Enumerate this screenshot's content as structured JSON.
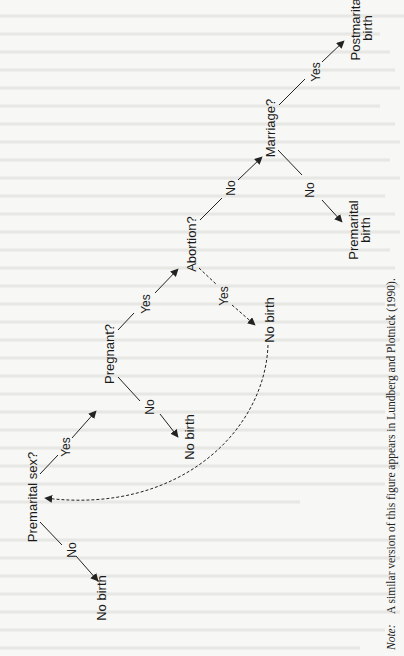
{
  "figure": {
    "type": "decision-tree",
    "orientation": "rotated-90-ccw",
    "nodes": {
      "premarital_sex": "Premarital sex?",
      "pregnant": "Pregnant?",
      "abortion": "Abortion?",
      "marriage": "Marriage?",
      "postmarital_birth_line1": "Postmarital",
      "postmarital_birth_line2": "birth",
      "premarital_birth_line1": "Premarital",
      "premarital_birth_line2": "birth",
      "no_birth_abortion": "No birth",
      "no_birth_not_pregnant": "No birth",
      "no_birth_no_sex": "No birth"
    },
    "edges": {
      "sex_yes": "Yes",
      "sex_no": "No",
      "pregnant_yes": "Yes",
      "pregnant_no": "No",
      "abortion_yes": "Yes",
      "abortion_no": "No",
      "marriage_yes": "Yes",
      "marriage_no": "No"
    },
    "note_label": "Note:",
    "note_text": "A similar version of this figure appears in Lundberg and Plotnick (1990)."
  }
}
